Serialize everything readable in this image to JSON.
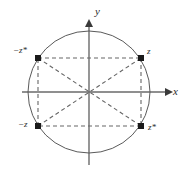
{
  "figure": {
    "background_color": "#ffffff",
    "stroke_color": "#555555",
    "dashed_color": "#666666",
    "point_color": "#1a1a1a",
    "axes": {
      "x_label": "x",
      "y_label": "y",
      "origin": {
        "x": 89,
        "y": 92
      },
      "x_axis": {
        "x1": 22,
        "y1": 92,
        "x2": 170,
        "y2": 92
      },
      "y_axis": {
        "x1": 89,
        "y1": 165,
        "x2": 89,
        "y2": 22
      },
      "x_arrow": "right",
      "y_arrow": "up"
    },
    "circle": {
      "center_x": 89,
      "center_y": 92,
      "radius": 61
    },
    "points": [
      {
        "id": "neg-z-conj",
        "label": "−z*",
        "x": 38,
        "y": 58
      },
      {
        "id": "z",
        "label": "z",
        "x": 141,
        "y": 58
      },
      {
        "id": "neg-z",
        "label": "−z",
        "x": 38,
        "y": 126
      },
      {
        "id": "z-conj",
        "label": "z*",
        "x": 141,
        "y": 126
      }
    ],
    "rectangle_edges": [
      {
        "from": "neg-z-conj",
        "to": "z"
      },
      {
        "from": "z",
        "to": "z-conj"
      },
      {
        "from": "z-conj",
        "to": "neg-z"
      },
      {
        "from": "neg-z",
        "to": "neg-z-conj"
      }
    ],
    "diagonals": [
      {
        "from": "neg-z-conj",
        "to": "z-conj"
      },
      {
        "from": "neg-z",
        "to": "z"
      }
    ],
    "dash_pattern": "4 3",
    "line_width": 1
  }
}
